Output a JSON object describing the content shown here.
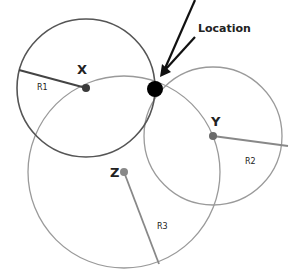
{
  "diagram": {
    "type": "trilateration",
    "annotation": {
      "label": "Location",
      "arrow_target": "intersection-point"
    },
    "points": [
      {
        "id": "X",
        "label": "X",
        "radius_label": "R1",
        "cx": 86,
        "cy": 88,
        "r": 69,
        "stroke": "#555555"
      },
      {
        "id": "Y",
        "label": "Y",
        "radius_label": "R2",
        "cx": 213,
        "cy": 136,
        "r": 69,
        "stroke": "#999999"
      },
      {
        "id": "Z",
        "label": "Z",
        "radius_label": "R3",
        "cx": 124,
        "cy": 172,
        "r": 96,
        "stroke": "#999999"
      }
    ],
    "location_point": {
      "cx": 155,
      "cy": 89,
      "r": 8,
      "color": "#000000"
    }
  },
  "labels": {
    "location": "Location",
    "x": "X",
    "y": "Y",
    "z": "Z",
    "r1": "R1",
    "r2": "R2",
    "r3": "R3"
  }
}
